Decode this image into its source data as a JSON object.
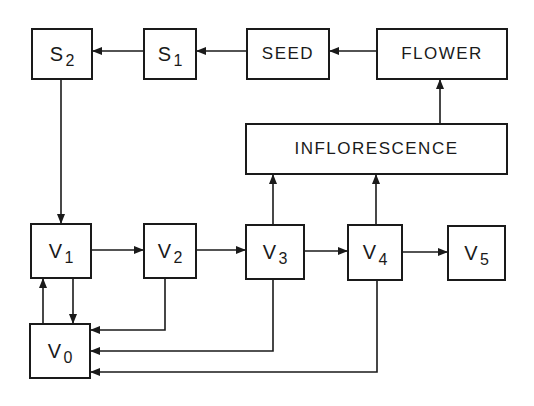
{
  "diagram": {
    "type": "flowchart",
    "colors": {
      "line": "#1a1a1a",
      "background": "#ffffff"
    },
    "nodes": [
      {
        "id": "S2",
        "main": "S",
        "sub": "2",
        "x": 31,
        "y": 28,
        "w": 62,
        "h": 52
      },
      {
        "id": "S1",
        "main": "S",
        "sub": "1",
        "x": 143,
        "y": 28,
        "w": 54,
        "h": 52
      },
      {
        "id": "SEED",
        "main": "SEED",
        "sub": "",
        "x": 246,
        "y": 28,
        "w": 84,
        "h": 52
      },
      {
        "id": "FLOWER",
        "main": "FLOWER",
        "sub": "",
        "x": 376,
        "y": 28,
        "w": 132,
        "h": 52
      },
      {
        "id": "INFLORESCENCE",
        "main": "INFLORESCENCE",
        "sub": "",
        "x": 245,
        "y": 123,
        "w": 263,
        "h": 52
      },
      {
        "id": "V1",
        "main": "V",
        "sub": "1",
        "x": 30,
        "y": 223,
        "w": 62,
        "h": 56
      },
      {
        "id": "V2",
        "main": "V",
        "sub": "2",
        "x": 143,
        "y": 223,
        "w": 54,
        "h": 56
      },
      {
        "id": "V3",
        "main": "V",
        "sub": "3",
        "x": 245,
        "y": 224,
        "w": 60,
        "h": 56
      },
      {
        "id": "V4",
        "main": "V",
        "sub": "4",
        "x": 347,
        "y": 224,
        "w": 56,
        "h": 57
      },
      {
        "id": "V5",
        "main": "V",
        "sub": "5",
        "x": 447,
        "y": 225,
        "w": 59,
        "h": 56
      },
      {
        "id": "V0",
        "main": "V",
        "sub": "0",
        "x": 29,
        "y": 323,
        "w": 62,
        "h": 56
      }
    ],
    "edges": [
      {
        "from": "FLOWER",
        "to": "SEED",
        "points": [
          [
            376,
            51
          ],
          [
            330,
            51
          ]
        ]
      },
      {
        "from": "SEED",
        "to": "S1",
        "points": [
          [
            246,
            51
          ],
          [
            197,
            51
          ]
        ]
      },
      {
        "from": "S1",
        "to": "S2",
        "points": [
          [
            143,
            51
          ],
          [
            93,
            51
          ]
        ]
      },
      {
        "from": "S2",
        "to": "V1",
        "points": [
          [
            61,
            80
          ],
          [
            61,
            223
          ]
        ]
      },
      {
        "from": "INFLORESCENCE",
        "to": "FLOWER",
        "points": [
          [
            440,
            123
          ],
          [
            440,
            80
          ]
        ]
      },
      {
        "from": "V3",
        "to": "INFLORESCENCE",
        "points": [
          [
            273,
            224
          ],
          [
            273,
            175
          ]
        ]
      },
      {
        "from": "V4",
        "to": "INFLORESCENCE",
        "points": [
          [
            376,
            224
          ],
          [
            376,
            175
          ]
        ]
      },
      {
        "from": "V1",
        "to": "V2",
        "points": [
          [
            92,
            250
          ],
          [
            143,
            250
          ]
        ]
      },
      {
        "from": "V2",
        "to": "V3",
        "points": [
          [
            197,
            250
          ],
          [
            245,
            250
          ]
        ]
      },
      {
        "from": "V3",
        "to": "V4",
        "points": [
          [
            305,
            251
          ],
          [
            347,
            251
          ]
        ]
      },
      {
        "from": "V4",
        "to": "V5",
        "points": [
          [
            403,
            252
          ],
          [
            447,
            252
          ]
        ]
      },
      {
        "from": "V1",
        "to": "V0",
        "points": [
          [
            73,
            279
          ],
          [
            73,
            323
          ]
        ]
      },
      {
        "from": "V0",
        "to": "V1",
        "points": [
          [
            43,
            323
          ],
          [
            43,
            279
          ]
        ]
      },
      {
        "from": "V2",
        "to": "V0",
        "points": [
          [
            165,
            279
          ],
          [
            165,
            330
          ],
          [
            91,
            330
          ]
        ]
      },
      {
        "from": "V3",
        "to": "V0",
        "points": [
          [
            273,
            280
          ],
          [
            273,
            351
          ],
          [
            91,
            351
          ]
        ]
      },
      {
        "from": "V4",
        "to": "V0",
        "points": [
          [
            377,
            281
          ],
          [
            377,
            372
          ],
          [
            91,
            372
          ]
        ]
      }
    ]
  }
}
